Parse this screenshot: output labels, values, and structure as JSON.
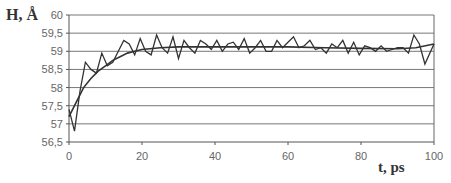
{
  "chart_data": {
    "type": "line",
    "title": "",
    "xlabel": "t, ps",
    "ylabel": "H, Å",
    "xlim": [
      0,
      100
    ],
    "ylim": [
      56.5,
      60
    ],
    "x_ticks": [
      "0",
      "20",
      "40",
      "60",
      "80",
      "100"
    ],
    "y_ticks": [
      "56,5",
      "57",
      "57,5",
      "58",
      "58,5",
      "59",
      "59,5",
      "60"
    ],
    "grid": {
      "horizontal": true,
      "vertical": false
    },
    "legend": null,
    "series": [
      {
        "name": "instantaneous",
        "x": [
          0,
          1.5,
          3,
          4.5,
          6,
          7.5,
          9,
          10.5,
          12,
          13.5,
          15,
          16.5,
          18,
          19.5,
          21,
          22.5,
          24,
          25.5,
          27,
          28.5,
          30,
          31.5,
          33,
          34.5,
          36,
          37.5,
          39,
          40.5,
          42,
          43.5,
          45,
          46.5,
          48,
          49.5,
          51,
          52.5,
          54,
          55.5,
          57,
          58.5,
          60,
          61.5,
          63,
          64.5,
          66,
          67.5,
          69,
          70.5,
          72,
          73.5,
          75,
          76.5,
          78,
          79.5,
          81,
          82.5,
          84,
          85.5,
          87,
          88.5,
          90,
          91.5,
          93,
          94.5,
          96,
          97.5,
          100
        ],
        "values": [
          57.4,
          56.8,
          57.9,
          58.7,
          58.5,
          58.4,
          58.95,
          58.6,
          58.7,
          59.0,
          59.3,
          59.2,
          58.9,
          59.35,
          59.0,
          58.9,
          59.45,
          59.1,
          58.95,
          59.4,
          58.8,
          59.3,
          59.1,
          58.95,
          59.3,
          59.2,
          59.05,
          59.3,
          59.0,
          59.2,
          59.25,
          59.05,
          59.35,
          58.95,
          59.1,
          59.3,
          59.0,
          59.0,
          59.3,
          59.1,
          59.25,
          59.4,
          59.1,
          59.15,
          59.3,
          59.05,
          59.1,
          58.95,
          59.2,
          59.1,
          59.3,
          58.95,
          59.25,
          58.9,
          59.15,
          59.1,
          59.0,
          59.15,
          59.0,
          59.05,
          59.1,
          59.1,
          58.95,
          59.45,
          59.2,
          58.65,
          59.2
        ]
      },
      {
        "name": "smoothed",
        "x": [
          0,
          2,
          4,
          6,
          8,
          10,
          12,
          14,
          16,
          18,
          20,
          25,
          30,
          40,
          50,
          60,
          70,
          80,
          90,
          95,
          100
        ],
        "values": [
          57.2,
          57.6,
          58.0,
          58.25,
          58.45,
          58.6,
          58.75,
          58.85,
          58.95,
          59.0,
          59.05,
          59.1,
          59.12,
          59.12,
          59.12,
          59.12,
          59.1,
          59.08,
          59.07,
          59.1,
          59.2
        ]
      }
    ]
  }
}
